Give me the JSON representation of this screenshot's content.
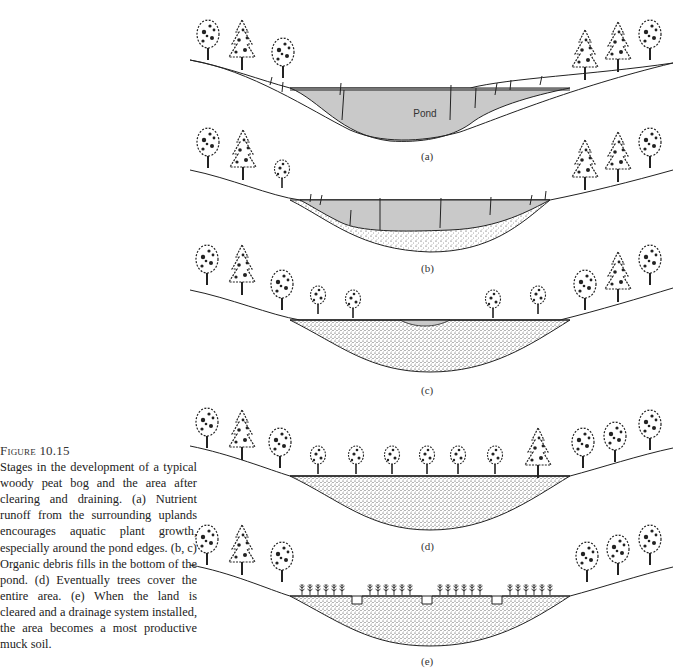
{
  "figure": {
    "number": "Figure 10.15",
    "caption": "Stages in the development of a typical woody peat bog and the area after clearing and draining. (a) Nutrient runoff from the surrounding uplands encourages aquatic plant growth, especially around the pond edges. (b, c) Organic debris fills in the bottom of the pond. (d) Eventually trees cover the entire area. (e) When the land is cleared and a drainage system installed, the area becomes a most productive muck soil."
  },
  "panels": [
    {
      "id": "a",
      "label": "(a)",
      "water_label": "Pond",
      "stage": "open pond with edge vegetation"
    },
    {
      "id": "b",
      "label": "(b)",
      "stage": "organic debris accumulating"
    },
    {
      "id": "c",
      "label": "(c)",
      "stage": "pond nearly filled"
    },
    {
      "id": "d",
      "label": "(d)",
      "stage": "trees cover entire area"
    },
    {
      "id": "e",
      "label": "(e)",
      "stage": "cleared and drained muck soil with crops"
    }
  ],
  "colors": {
    "water": "#c9c9c9",
    "line": "#222222",
    "peat": "#f3f3f3"
  }
}
